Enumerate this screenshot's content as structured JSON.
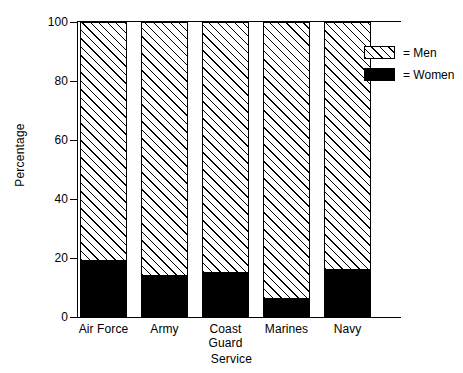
{
  "chart_data": {
    "type": "bar",
    "subtype": "stacked-percentage",
    "title": "",
    "xlabel": "Service",
    "ylabel": "Percentage",
    "categories": [
      "Air Force",
      "Army",
      "Coast Guard",
      "Marines",
      "Navy"
    ],
    "category_lines": [
      [
        "Air Force"
      ],
      [
        "Army"
      ],
      [
        "Coast",
        "Guard"
      ],
      [
        "Marines"
      ],
      [
        "Navy"
      ]
    ],
    "series": [
      {
        "name": "Men",
        "values": [
          81,
          86,
          85,
          94,
          84
        ],
        "fill": "diagonal-hatch"
      },
      {
        "name": "Women",
        "values": [
          19,
          14,
          15,
          6,
          16
        ],
        "fill": "solid-black"
      }
    ],
    "ylim": [
      0,
      100
    ],
    "yticks": [
      0,
      20,
      40,
      60,
      80,
      100
    ],
    "ytick_labels": [
      "0",
      "20",
      "40",
      "60",
      "80",
      "100"
    ],
    "grid": false,
    "legend_position": "top-right",
    "legend_entries": [
      {
        "label": "= Men",
        "swatch": "diagonal-hatch"
      },
      {
        "label": "= Women",
        "swatch": "solid-black"
      }
    ],
    "colors": {
      "men": "#ffffff",
      "women": "#000000",
      "outline": "#000000",
      "axis": "#000000"
    }
  }
}
